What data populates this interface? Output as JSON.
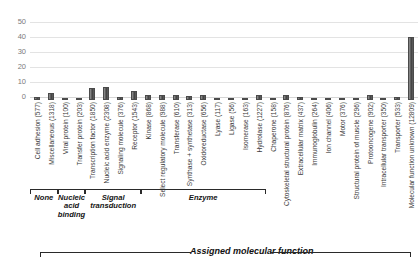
{
  "chart_data": {
    "type": "bar",
    "title": "",
    "xlabel": "Assigned molecular function",
    "ylabel": "",
    "ylim": [
      0,
      50
    ],
    "yticks": [
      "0",
      "10",
      "20",
      "30",
      "40",
      "50"
    ],
    "grid": true,
    "legend": "none",
    "categories": [
      "Cell adhesion (577)",
      "Miscellaneous (1318)",
      "Viral protein (100)",
      "Transfer protein (203)",
      "Transcription factor (1850)",
      "Nucleic acid enzyme (2308)",
      "Signaling molecule (376)",
      "Receptor (1543)",
      "Kinase (868)",
      "Select regulatory molecule (988)",
      "Transferase (610)",
      "Synthase + synthetase (313)",
      "Oxidoreductase (656)",
      "Lyase (117)",
      "Ligase (56)",
      "Isomerase (163)",
      "Hydrolase (1227)",
      "Chaperone (158)",
      "Cytoskeletal structural protein (876)",
      "Extracellular matrix (437)",
      "Immunoglobulin (264)",
      "Ion channel (406)",
      "Motor (376)",
      "Structural protein of muscle (296)",
      "Protooncogene (902)",
      "Intracellular transporter (350)",
      "Transporter (533)",
      "Molecular function unknown (12809)"
    ],
    "values": [
      2,
      5,
      0.8,
      1.2,
      8,
      8.5,
      2,
      6,
      3.5,
      3.5,
      3.2,
      2.6,
      3.2,
      1.2,
      0.8,
      1,
      3.4,
      1.2,
      3.2,
      1.8,
      1.6,
      1.6,
      1.5,
      1.3,
      3.6,
      1,
      2,
      42
    ],
    "groups": [
      {
        "label": "None",
        "start": 0,
        "end": 2
      },
      {
        "label": "Nucleic acid binding",
        "start": 2,
        "end": 4
      },
      {
        "label": "Signal transduction",
        "start": 4,
        "end": 8
      },
      {
        "label": "Enzyme",
        "start": 8,
        "end": 17
      }
    ]
  },
  "axis": {
    "bottom_title": "Assigned molecular function"
  },
  "colors": {
    "bar": "#4a4a4a",
    "grid": "#e3e3e3",
    "tick_text": "#7b7b7b",
    "label_text": "#3b3b3b"
  }
}
